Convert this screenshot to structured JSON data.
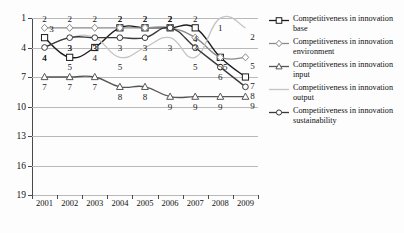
{
  "chart_data": {
    "type": "line",
    "title": "",
    "xlabel": "",
    "ylabel": "",
    "x": [
      "2001",
      "2002",
      "2003",
      "2004",
      "2005",
      "2006",
      "2007",
      "2008",
      "2009"
    ],
    "categories": [
      "2001",
      "2002",
      "2003",
      "2004",
      "2005",
      "2006",
      "2007",
      "2008",
      "2009"
    ],
    "ylim": [
      1,
      19
    ],
    "y_inverted": true,
    "yticks": [
      "1",
      "4",
      "7",
      "10",
      "13",
      "16",
      "19"
    ],
    "grid": true,
    "legend_position": "right",
    "series": [
      {
        "name": "Competitiveness in innovation base",
        "marker": "square",
        "color": "#1c1c1c",
        "values": [
          3,
          5,
          4,
          2,
          2,
          2,
          2,
          5,
          7
        ]
      },
      {
        "name": "Competitiveness in innovation environment",
        "marker": "diamond",
        "color": "#8a8a8a",
        "values": [
          2,
          2,
          2,
          2,
          2,
          2,
          3,
          5,
          5
        ]
      },
      {
        "name": "Competitiveness in innovation input",
        "marker": "triangle",
        "color": "#555555",
        "values": [
          7,
          7,
          7,
          8,
          8,
          9,
          9,
          9,
          9
        ]
      },
      {
        "name": "Competitiveness in innovation output",
        "marker": "none",
        "color": "#c4c4c4",
        "values": [
          4,
          3,
          3,
          5,
          4,
          3,
          5,
          1,
          2
        ]
      },
      {
        "name": "Competitiveness in innovation sustainability",
        "marker": "circle",
        "color": "#3a3a3a",
        "values": [
          4,
          3,
          3,
          3,
          3,
          2,
          4,
          6,
          8
        ]
      }
    ]
  },
  "legend": {
    "items": [
      {
        "label": "Competitiveness in innovation base",
        "key": "square-marker-key"
      },
      {
        "label": "Competitiveness in innovation environment",
        "key": "diamond-marker-key"
      },
      {
        "label": "Competitiveness in innovation input",
        "key": "triangle-marker-key"
      },
      {
        "label": "Competitiveness in innovation output",
        "key": "line-only-key"
      },
      {
        "label": "Competitiveness in innovation sustainability",
        "key": "circle-marker-key"
      }
    ]
  }
}
